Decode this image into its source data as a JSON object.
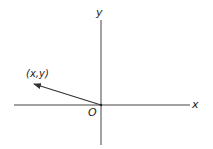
{
  "diagram": {
    "type": "coordinate-plane-vector",
    "axes": {
      "x_label": "x",
      "y_label": "y",
      "origin_label": "O"
    },
    "vector": {
      "label": "(x,y)",
      "direction": "second-quadrant"
    },
    "colors": {
      "line": "#333333",
      "background": "#ffffff"
    }
  }
}
